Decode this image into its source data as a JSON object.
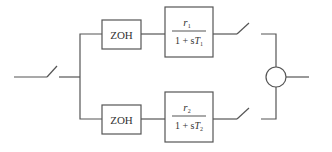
{
  "diagram": {
    "type": "block-diagram",
    "colors": {
      "line": "#555555",
      "text": "#333333",
      "background": "#ffffff"
    },
    "input": {
      "switch": "sampler-switch-input"
    },
    "branches": [
      {
        "hold": {
          "label": "ZOH"
        },
        "transfer_function": {
          "numerator": "r",
          "numerator_sub": "1",
          "denominator_prefix": "1 + s",
          "denominator_var": "T",
          "denominator_sub": "1"
        },
        "output_switch": "sampler-switch-1"
      },
      {
        "hold": {
          "label": "ZOH"
        },
        "transfer_function": {
          "numerator": "r",
          "numerator_sub": "2",
          "denominator_prefix": "1 + s",
          "denominator_var": "T",
          "denominator_sub": "2"
        },
        "output_switch": "sampler-switch-2"
      }
    ],
    "summing_junction": {
      "symbol": "circle"
    }
  }
}
